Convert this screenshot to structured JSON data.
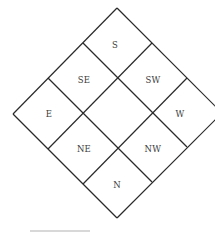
{
  "diagram": {
    "type": "compass-grid-3x3-rotated",
    "line_color": "#2a2a2a",
    "cells": [
      {
        "id": "s",
        "label": "S"
      },
      {
        "id": "se",
        "label": "SE"
      },
      {
        "id": "sw",
        "label": "SW"
      },
      {
        "id": "e",
        "label": "E"
      },
      {
        "id": "center",
        "label": ""
      },
      {
        "id": "w",
        "label": "W"
      },
      {
        "id": "ne",
        "label": "NE"
      },
      {
        "id": "nw",
        "label": "NW"
      },
      {
        "id": "n",
        "label": "N"
      }
    ]
  }
}
